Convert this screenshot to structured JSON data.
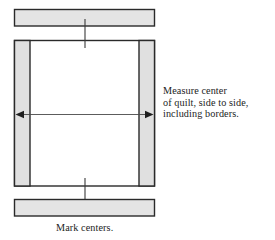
{
  "figure": {
    "colors": {
      "fill_light": "#e4e4e4",
      "fill_strip": "#e0e0e0",
      "fill_center": "#ffffff",
      "stroke_dark": "#2a2a2a",
      "stroke_thin": "#4a4a4a",
      "text": "#1c1c1c",
      "page_background": "#ffffff"
    },
    "parts": {
      "top_border_strip_label": "top border strip",
      "bottom_border_strip_label": "bottom border strip",
      "quilt_body_label": "quilt body",
      "left_side_border_label": "left side border",
      "right_side_border_label": "right side border",
      "center_field_label": "quilt center field",
      "measure_arrow_label": "side-to-side measurement arrow",
      "center_tick_label": "center tick mark"
    }
  },
  "annotations": {
    "side_note": {
      "line1": "Measure center",
      "line2": "of quilt, side to side,",
      "line3": "including borders."
    },
    "bottom_note": {
      "line1": "Mark centers."
    }
  },
  "geometry": {
    "top_strip": {
      "x": 14,
      "y": 9,
      "w": 141,
      "h": 17
    },
    "bottom_strip": {
      "x": 14,
      "y": 199,
      "w": 141,
      "h": 17
    },
    "body": {
      "x": 14,
      "y": 40,
      "w": 141,
      "h": 146
    },
    "left_border": {
      "x": 14,
      "y": 40,
      "w": 16,
      "h": 146
    },
    "right_border": {
      "x": 139,
      "y": 40,
      "w": 16,
      "h": 146
    },
    "arrow_y": 114,
    "center_x": 85
  }
}
